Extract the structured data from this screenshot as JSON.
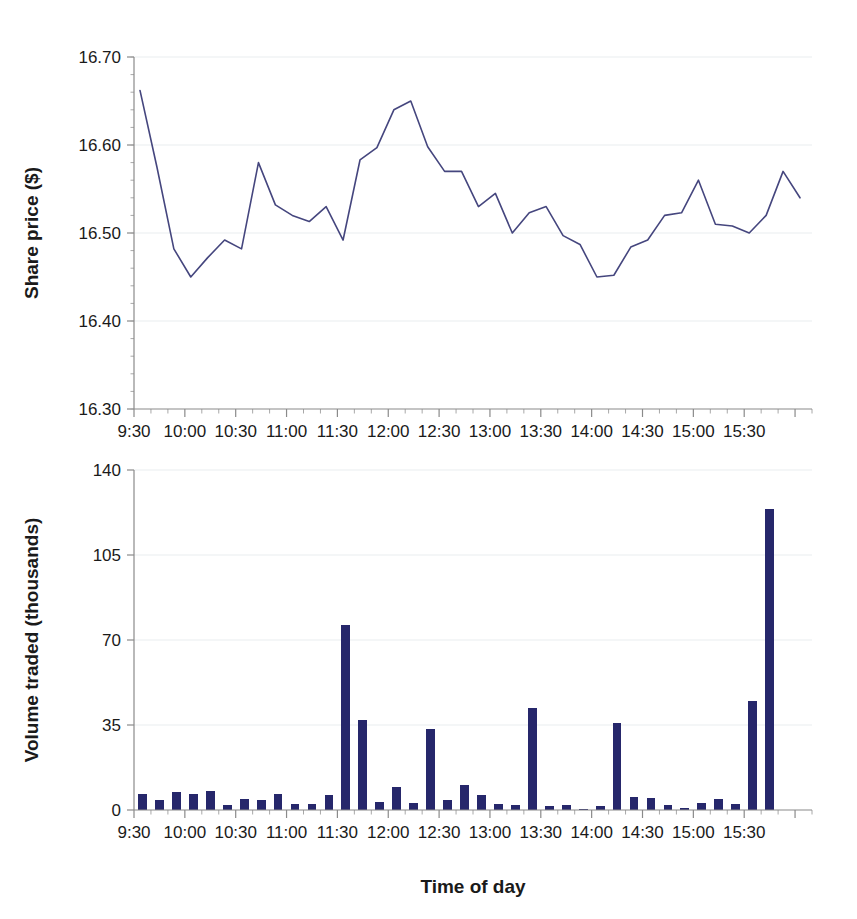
{
  "chart_data": [
    {
      "type": "line",
      "id": "share-price",
      "title": "",
      "xlabel": "",
      "ylabel": "Share price ($)",
      "ylim": [
        16.3,
        16.7
      ],
      "yticks": [
        16.3,
        16.4,
        16.5,
        16.6,
        16.7
      ],
      "ytick_labels": [
        "16.30",
        "16.40",
        "16.50",
        "16.60",
        "16.70"
      ],
      "xlim": [
        "9:30",
        "16:00"
      ],
      "xticks": [
        "9:30",
        "10:00",
        "10:30",
        "11:00",
        "11:30",
        "12:00",
        "12:30",
        "13:00",
        "13:30",
        "14:00",
        "14:30",
        "15:00",
        "15:30"
      ],
      "xtick_labels": [
        "9:30",
        "10:00",
        "10:30",
        "11:00",
        "11:30",
        "12:00",
        "12:30",
        "13:00",
        "13:30",
        "14:00",
        "14:30",
        "15:00",
        "15:30"
      ],
      "grid": true,
      "interval_minutes": 10,
      "color": "#45467e",
      "x": [
        "9:30",
        "9:40",
        "9:50",
        "10:00",
        "10:10",
        "10:20",
        "10:30",
        "10:40",
        "10:50",
        "11:00",
        "11:10",
        "11:20",
        "11:30",
        "11:40",
        "11:50",
        "12:00",
        "12:10",
        "12:20",
        "12:30",
        "12:40",
        "12:50",
        "13:00",
        "13:10",
        "13:20",
        "13:30",
        "13:40",
        "13:50",
        "14:00",
        "14:10",
        "14:20",
        "14:30",
        "14:40",
        "14:50",
        "15:00",
        "15:10",
        "15:20",
        "15:30",
        "15:40",
        "15:50"
      ],
      "values": [
        16.662,
        16.575,
        16.482,
        16.45,
        16.472,
        16.492,
        16.482,
        16.58,
        16.532,
        16.52,
        16.513,
        16.53,
        16.492,
        16.583,
        16.597,
        16.64,
        16.65,
        16.598,
        16.57,
        16.57,
        16.53,
        16.545,
        16.5,
        16.523,
        16.53,
        16.497,
        16.487,
        16.45,
        16.452,
        16.484,
        16.492,
        16.52,
        16.523,
        16.56,
        16.51,
        16.508,
        16.5,
        16.52,
        16.57,
        16.54
      ]
    },
    {
      "type": "bar",
      "id": "volume-traded",
      "title": "",
      "xlabel": "Time of day",
      "ylabel": "Volume traded (thousands)",
      "ylim": [
        0,
        140
      ],
      "yticks": [
        0,
        35,
        70,
        105,
        140
      ],
      "ytick_labels": [
        "0",
        "35",
        "70",
        "105",
        "140"
      ],
      "xticks": [
        "9:30",
        "10:00",
        "10:30",
        "11:00",
        "11:30",
        "12:00",
        "12:30",
        "13:00",
        "13:30",
        "14:00",
        "14:30",
        "15:00",
        "15:30"
      ],
      "xtick_labels": [
        "9:30",
        "10:00",
        "10:30",
        "11:00",
        "11:30",
        "12:00",
        "12:30",
        "13:00",
        "13:30",
        "14:00",
        "14:30",
        "15:00",
        "15:30"
      ],
      "grid": true,
      "interval_minutes": 10,
      "color": "#26276b",
      "categories": [
        "9:30",
        "9:40",
        "9:50",
        "10:00",
        "10:10",
        "10:20",
        "10:30",
        "10:40",
        "10:50",
        "11:00",
        "11:10",
        "11:20",
        "11:30",
        "11:40",
        "11:50",
        "12:00",
        "12:10",
        "12:20",
        "12:30",
        "12:40",
        "12:50",
        "13:00",
        "13:10",
        "13:20",
        "13:30",
        "13:40",
        "13:50",
        "14:00",
        "14:10",
        "14:20",
        "14:30",
        "14:40",
        "14:50",
        "15:00",
        "15:10",
        "15:20",
        "15:30",
        "15:40",
        "15:50"
      ],
      "values": [
        6.5,
        4.0,
        7.5,
        6.5,
        8.0,
        2.0,
        4.5,
        4.0,
        6.5,
        2.5,
        2.5,
        6.0,
        76.0,
        37.0,
        3.5,
        9.5,
        3.0,
        33.5,
        4.0,
        10.5,
        6.0,
        2.5,
        2.0,
        42.0,
        1.5,
        2.0,
        0.5,
        1.5,
        36.0,
        5.5,
        5.0,
        2.0,
        1.0,
        3.0,
        4.5,
        2.5,
        45.0,
        124.0,
        0
      ]
    }
  ],
  "figure": {
    "price_axis_title": "Share price ($)",
    "volume_axis_title": "Volume traded (thousands)",
    "x_axis_title": "Time of day"
  }
}
